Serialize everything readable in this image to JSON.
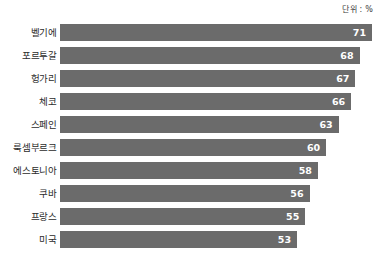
{
  "unit_caption": "단위 : %",
  "chart_data": {
    "type": "bar",
    "orientation": "horizontal",
    "title": "",
    "subtitle": "",
    "xlabel": "",
    "ylabel": "",
    "unit": "%",
    "grid": false,
    "legend": null,
    "axis_visible": false,
    "sorted": "descending",
    "categories": [
      "벨기에",
      "포르투갈",
      "헝가리",
      "체코",
      "스페인",
      "룩셈부르크",
      "에스토니아",
      "쿠바",
      "프랑스",
      "미국"
    ],
    "values": [
      71,
      68,
      67,
      66,
      63,
      60,
      58,
      56,
      55,
      53
    ],
    "value_labels": [
      "71",
      "68",
      "67",
      "66",
      "63",
      "60",
      "58",
      "56",
      "55",
      "53"
    ],
    "xlim": [
      0,
      75
    ],
    "bar_color": "#6b6b6b",
    "value_label_color": "#ffffff",
    "category_label_color": "#2b2b2b",
    "background_color": "#ffffff"
  },
  "geometry": {
    "bar_left_px": 60,
    "bar_height_px": 17,
    "row_pitch_px": 23,
    "px_per_unit": 4.17,
    "value_origin_px": 76
  }
}
